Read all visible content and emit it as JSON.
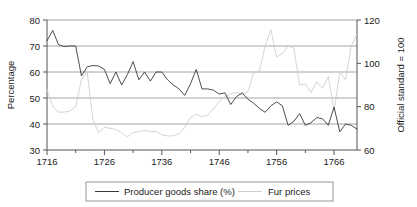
{
  "chart_data": {
    "type": "line",
    "title": "",
    "xlabel": "",
    "ylabel": "Percentage",
    "y2label": "Official standard = 100",
    "xlim": [
      1716,
      1770
    ],
    "ylim": [
      30,
      80
    ],
    "y2lim": [
      60,
      120
    ],
    "grid": true,
    "legend_position": "bottom",
    "x_ticks": [
      1716,
      1726,
      1736,
      1746,
      1756,
      1766
    ],
    "x_tick_labels": [
      "1716",
      "1726",
      "1736",
      "1746",
      "1756",
      "1766"
    ],
    "x_minor_ticks": [
      1721,
      1731,
      1741,
      1751,
      1761
    ],
    "y_ticks": [
      30,
      40,
      50,
      60,
      70,
      80
    ],
    "y_tick_labels": [
      "30",
      "40",
      "50",
      "60",
      "70",
      "80"
    ],
    "y2_ticks": [
      60,
      80,
      100,
      120
    ],
    "y2_tick_labels": [
      "60",
      "80",
      "100",
      "120"
    ],
    "x": [
      1716,
      1717,
      1718,
      1719,
      1720,
      1721,
      1722,
      1723,
      1724,
      1725,
      1726,
      1727,
      1728,
      1729,
      1730,
      1731,
      1732,
      1733,
      1734,
      1735,
      1736,
      1737,
      1738,
      1739,
      1740,
      1741,
      1742,
      1743,
      1744,
      1745,
      1746,
      1747,
      1748,
      1749,
      1750,
      1751,
      1752,
      1753,
      1754,
      1755,
      1756,
      1757,
      1758,
      1759,
      1760,
      1761,
      1762,
      1763,
      1764,
      1765,
      1766,
      1767,
      1768,
      1769,
      1770
    ],
    "series": [
      {
        "name": "Producer goods share (%)",
        "axis": "left",
        "color": "#3a3a3a",
        "values": [
          72.0,
          76.0,
          70.5,
          69.8,
          70.0,
          70.0,
          58.5,
          62.0,
          62.5,
          62.3,
          61.0,
          55.5,
          60.0,
          55.0,
          59.0,
          64.0,
          57.0,
          60.0,
          56.5,
          60.0,
          60.0,
          57.0,
          55.0,
          53.5,
          51.0,
          55.5,
          61.0,
          53.5,
          53.5,
          53.0,
          51.5,
          52.0,
          47.5,
          50.5,
          52.0,
          49.5,
          48.0,
          46.0,
          44.5,
          47.0,
          48.5,
          47.0,
          39.5,
          41.0,
          44.0,
          39.5,
          40.5,
          42.5,
          42.0,
          39.5,
          46.5,
          37.0,
          40.0,
          39.5,
          38.0
        ]
      },
      {
        "name": "Fur prices",
        "axis": "right",
        "color": "#cfcfcf",
        "values": [
          88.0,
          80.0,
          77.5,
          77.5,
          78.0,
          80.0,
          92.5,
          96.0,
          74.0,
          68.0,
          70.5,
          70.0,
          69.5,
          68.0,
          66.0,
          68.0,
          68.5,
          69.0,
          68.5,
          68.5,
          67.0,
          66.5,
          66.5,
          67.5,
          70.5,
          75.0,
          76.5,
          75.5,
          76.0,
          79.0,
          82.5,
          84.5,
          86.0,
          86.5,
          85.5,
          87.0,
          95.5,
          96.5,
          108.0,
          115.5,
          103.0,
          104.5,
          108.0,
          107.0,
          90.0,
          90.5,
          86.5,
          91.5,
          88.5,
          94.0,
          78.0,
          96.0,
          92.5,
          108.0,
          113.5
        ]
      }
    ],
    "secondary_tail": {
      "note": "later years extend beyond last labeled tick",
      "values": []
    }
  },
  "legend": {
    "entries": [
      {
        "label": "Producer goods share (%)",
        "swatch": "line-dark"
      },
      {
        "label": "Fur prices",
        "swatch": "line-light"
      }
    ]
  },
  "axes": {
    "left_title": "Percentage",
    "right_title": "Official standard = 100"
  }
}
